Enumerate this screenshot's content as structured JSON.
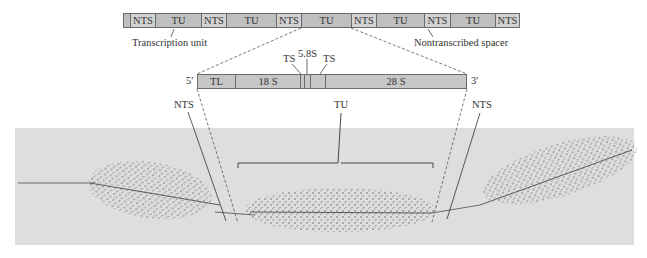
{
  "top_bar": {
    "segments": [
      {
        "label": "",
        "type": "tu",
        "x": 0,
        "w": 7
      },
      {
        "label": "NTS",
        "type": "nts",
        "x": 7,
        "w": 25
      },
      {
        "label": "TU",
        "type": "tu",
        "x": 32,
        "w": 46
      },
      {
        "label": "NTS",
        "type": "nts",
        "x": 78,
        "w": 25
      },
      {
        "label": "TU",
        "type": "tu",
        "x": 103,
        "w": 50
      },
      {
        "label": "NTS",
        "type": "nts",
        "x": 153,
        "w": 25
      },
      {
        "label": "TU",
        "type": "tu",
        "x": 178,
        "w": 50
      },
      {
        "label": "NTS",
        "type": "nts",
        "x": 228,
        "w": 25
      },
      {
        "label": "TU",
        "type": "tu",
        "x": 253,
        "w": 48
      },
      {
        "label": "NTS",
        "type": "nts",
        "x": 301,
        "w": 26
      },
      {
        "label": "TU",
        "type": "tu",
        "x": 327,
        "w": 45
      },
      {
        "label": "NTS",
        "type": "nts",
        "x": 372,
        "w": 25
      }
    ],
    "callout_left": "Transcription unit",
    "callout_right": "Nontranscribed spacer"
  },
  "gene_bar": {
    "end_5": "5′",
    "end_3": "3′",
    "segments": [
      {
        "label": "TL",
        "x": 0,
        "w": 38
      },
      {
        "label": "18 S",
        "x": 38,
        "w": 65
      },
      {
        "label": "",
        "x": 103,
        "w": 4
      },
      {
        "label": "",
        "x": 107,
        "w": 6
      },
      {
        "label": "",
        "x": 113,
        "w": 15
      },
      {
        "label": "28 S",
        "x": 128,
        "w": 142
      }
    ],
    "label_ts_left": "TS",
    "label_58s": "5.8S",
    "label_ts_right": "TS"
  },
  "micrograph": {
    "label_nts_left": "NTS",
    "label_tu": "TU",
    "label_nts_right": "NTS",
    "background": "#dedede"
  }
}
